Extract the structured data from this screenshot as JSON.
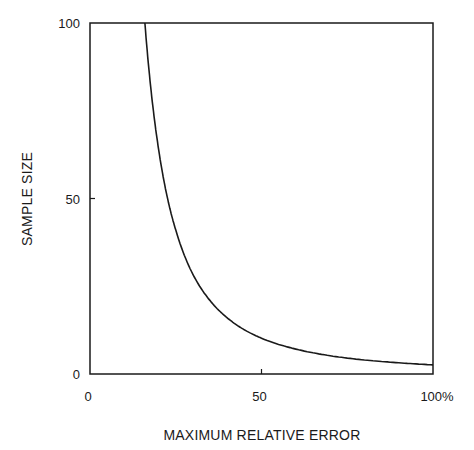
{
  "chart_data": {
    "type": "line",
    "title": "",
    "xlabel": "MAXIMUM RELATIVE ERROR",
    "ylabel": "SAMPLE SIZE",
    "xlim": [
      0,
      100
    ],
    "ylim": [
      0,
      100
    ],
    "x_ticks": [
      {
        "value": 0,
        "label": "0"
      },
      {
        "value": 50,
        "label": "50"
      },
      {
        "value": 100,
        "label": "100%"
      }
    ],
    "y_ticks": [
      {
        "value": 0,
        "label": "0"
      },
      {
        "value": 50,
        "label": "50"
      },
      {
        "value": 100,
        "label": "100"
      }
    ],
    "grid": false,
    "legend": null,
    "series": [
      {
        "name": "sample size vs. max relative error",
        "x": [
          16,
          18,
          20,
          22.7,
          25,
          30,
          35,
          40,
          45,
          50,
          60,
          70,
          80,
          90,
          100
        ],
        "y": [
          100,
          79,
          64,
          49.6,
          41,
          28.4,
          20.9,
          16,
          12.6,
          10.2,
          7.1,
          5.2,
          4,
          3.2,
          2.6
        ]
      }
    ]
  }
}
